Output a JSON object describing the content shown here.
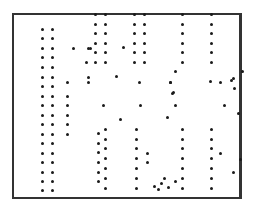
{
  "figure": {
    "frame_color": "#333333",
    "dot_color": "#1a1a1a",
    "dots": [
      [
        42,
        29
      ],
      [
        52,
        29
      ],
      [
        42,
        38
      ],
      [
        52,
        38
      ],
      [
        42,
        48
      ],
      [
        52,
        48
      ],
      [
        42,
        57
      ],
      [
        52,
        57
      ],
      [
        42,
        67
      ],
      [
        52,
        67
      ],
      [
        42,
        77
      ],
      [
        52,
        77
      ],
      [
        42,
        86
      ],
      [
        52,
        86
      ],
      [
        42,
        96
      ],
      [
        52,
        96
      ],
      [
        42,
        105
      ],
      [
        52,
        105
      ],
      [
        42,
        115
      ],
      [
        52,
        115
      ],
      [
        42,
        124
      ],
      [
        52,
        124
      ],
      [
        42,
        134
      ],
      [
        52,
        134
      ],
      [
        42,
        143
      ],
      [
        52,
        143
      ],
      [
        42,
        153
      ],
      [
        52,
        153
      ],
      [
        42,
        162
      ],
      [
        52,
        162
      ],
      [
        42,
        172
      ],
      [
        52,
        172
      ],
      [
        42,
        181
      ],
      [
        52,
        181
      ],
      [
        42,
        190
      ],
      [
        52,
        190
      ],
      [
        67,
        82
      ],
      [
        67,
        96
      ],
      [
        67,
        105
      ],
      [
        67,
        115
      ],
      [
        67,
        124
      ],
      [
        67,
        134
      ],
      [
        73,
        48
      ],
      [
        88,
        48
      ],
      [
        86,
        62
      ],
      [
        88,
        82
      ],
      [
        90,
        48
      ],
      [
        95,
        14
      ],
      [
        105,
        14
      ],
      [
        95,
        24
      ],
      [
        105,
        24
      ],
      [
        95,
        33
      ],
      [
        105,
        33
      ],
      [
        95,
        43
      ],
      [
        105,
        43
      ],
      [
        95,
        52
      ],
      [
        105,
        52
      ],
      [
        95,
        62
      ],
      [
        105,
        62
      ],
      [
        98,
        133
      ],
      [
        105,
        129
      ],
      [
        98,
        143
      ],
      [
        105,
        139
      ],
      [
        98,
        152
      ],
      [
        105,
        148
      ],
      [
        98,
        162
      ],
      [
        105,
        158
      ],
      [
        98,
        172
      ],
      [
        105,
        168
      ],
      [
        98,
        181
      ],
      [
        105,
        178
      ],
      [
        105,
        188
      ],
      [
        116,
        76
      ],
      [
        103,
        105
      ],
      [
        120,
        119
      ],
      [
        123,
        47
      ],
      [
        88,
        77
      ],
      [
        134,
        14
      ],
      [
        144,
        14
      ],
      [
        134,
        24
      ],
      [
        144,
        24
      ],
      [
        134,
        33
      ],
      [
        144,
        33
      ],
      [
        134,
        43
      ],
      [
        144,
        43
      ],
      [
        134,
        52
      ],
      [
        144,
        52
      ],
      [
        134,
        62
      ],
      [
        144,
        62
      ],
      [
        140,
        105
      ],
      [
        139,
        82
      ],
      [
        136,
        129
      ],
      [
        136,
        139
      ],
      [
        136,
        148
      ],
      [
        136,
        158
      ],
      [
        136,
        168
      ],
      [
        136,
        178
      ],
      [
        136,
        188
      ],
      [
        147,
        153
      ],
      [
        147,
        162
      ],
      [
        154,
        186
      ],
      [
        158,
        189
      ],
      [
        161,
        183
      ],
      [
        168,
        187
      ],
      [
        164,
        178
      ],
      [
        175,
        181
      ],
      [
        175,
        71
      ],
      [
        170,
        82
      ],
      [
        175,
        105
      ],
      [
        182,
        14
      ],
      [
        211,
        14
      ],
      [
        182,
        24
      ],
      [
        211,
        24
      ],
      [
        182,
        33
      ],
      [
        211,
        33
      ],
      [
        182,
        43
      ],
      [
        211,
        43
      ],
      [
        182,
        52
      ],
      [
        211,
        52
      ],
      [
        182,
        62
      ],
      [
        211,
        62
      ],
      [
        172,
        93
      ],
      [
        167,
        117
      ],
      [
        170,
        82
      ],
      [
        182,
        129
      ],
      [
        182,
        139
      ],
      [
        182,
        148
      ],
      [
        182,
        158
      ],
      [
        182,
        168
      ],
      [
        182,
        178
      ],
      [
        182,
        188
      ],
      [
        211,
        129
      ],
      [
        211,
        139
      ],
      [
        211,
        148
      ],
      [
        211,
        158
      ],
      [
        211,
        168
      ],
      [
        211,
        178
      ],
      [
        211,
        188
      ],
      [
        220,
        153
      ],
      [
        233,
        172
      ],
      [
        240,
        159
      ],
      [
        220,
        82
      ],
      [
        231,
        80
      ],
      [
        234,
        88
      ],
      [
        224,
        105
      ],
      [
        238,
        113
      ],
      [
        242,
        71
      ],
      [
        173,
        92
      ],
      [
        210,
        81
      ],
      [
        233,
        78
      ]
    ]
  }
}
